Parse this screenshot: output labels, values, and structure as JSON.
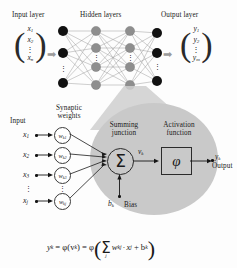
{
  "figure": {
    "network": {
      "layer_labels": {
        "input": "Input layer",
        "hidden": "Hidden layers",
        "output": "Output layer"
      },
      "input_vector": [
        "x",
        "1",
        "x",
        "2",
        "⋮",
        "x",
        "n"
      ],
      "input_vector_items": [
        {
          "base": "x",
          "sub": "1"
        },
        {
          "base": "x",
          "sub": "2"
        },
        {
          "base": "⋮",
          "sub": ""
        },
        {
          "base": "x",
          "sub": "n"
        }
      ],
      "output_vector_items": [
        {
          "base": "y",
          "sub": "1"
        },
        {
          "base": "y",
          "sub": "2"
        },
        {
          "base": "⋮",
          "sub": ""
        },
        {
          "base": "y",
          "sub": "m"
        }
      ],
      "arrow_glyph": "➡",
      "node_counts": {
        "input": 3,
        "hidden_layer_1": 4,
        "hidden_layer_2": 4,
        "output": 3
      },
      "hidden_layer_count": 2,
      "ellipsis_glyph": "⋮",
      "colors": {
        "input_node": "#111111",
        "hidden_node": "#8c8c8c",
        "output_node": "#111111",
        "edge": "#8a8a8a"
      }
    },
    "neuron": {
      "labels": {
        "input": "Input",
        "synaptic_weights": "Synaptic weights",
        "summing_junction": "Summing junction",
        "activation_function": "Activation function",
        "bias": "Bias",
        "output": "Output"
      },
      "inputs": [
        {
          "base": "x",
          "sub": "1"
        },
        {
          "base": "x",
          "sub": "2"
        },
        {
          "base": "x",
          "sub": "3"
        },
        {
          "base": "⋮",
          "sub": ""
        },
        {
          "base": "x",
          "sub": "j"
        }
      ],
      "weights": [
        {
          "base": "w",
          "sub": "k1"
        },
        {
          "base": "w",
          "sub": "k2"
        },
        {
          "base": "w",
          "sub": "k3"
        },
        {
          "base": "⋮",
          "sub": ""
        },
        {
          "base": "w",
          "sub": "kj"
        }
      ],
      "summation_glyph": "Σ",
      "induced_field": {
        "base": "v",
        "sub": "k"
      },
      "activation_glyph": "φ",
      "bias_symbol": {
        "base": "b",
        "sub": "k"
      },
      "output_symbol": {
        "base": "y",
        "sub": "k"
      },
      "disc_color": "#c9c9c9"
    },
    "equation": {
      "lhs": "y",
      "lhs_sub": "k",
      "eq1": "= φ(v",
      "eq1_sub": "k",
      "eq2": ") = φ",
      "sum": "Σ",
      "sum_sub": "j",
      "term_w": "w",
      "term_w_sub": "kj",
      "dot": "·",
      "term_x": "x",
      "term_x_sub": "j",
      "plus": "+ b",
      "plus_sub": "k",
      "full": "y_k = φ(v_k) = φ( Σ_j w_kj · x_j + b_k )"
    }
  }
}
